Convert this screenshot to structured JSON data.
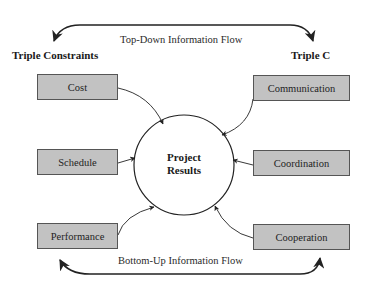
{
  "diagram": {
    "top_flow_label": "Top-Down Information Flow",
    "bottom_flow_label": "Bottom-Up Information Flow",
    "left_heading": "Triple Constraints",
    "right_heading": "Triple C",
    "center": {
      "line1": "Project",
      "line2": "Results"
    },
    "left_boxes": [
      {
        "label": "Cost"
      },
      {
        "label": "Schedule"
      },
      {
        "label": "Performance"
      }
    ],
    "right_boxes": [
      {
        "label": "Communication"
      },
      {
        "label": "Coordination"
      },
      {
        "label": "Cooperation"
      }
    ],
    "colors": {
      "box_fill": "#c2c2c2",
      "box_border": "#555555",
      "line": "#222222"
    }
  }
}
